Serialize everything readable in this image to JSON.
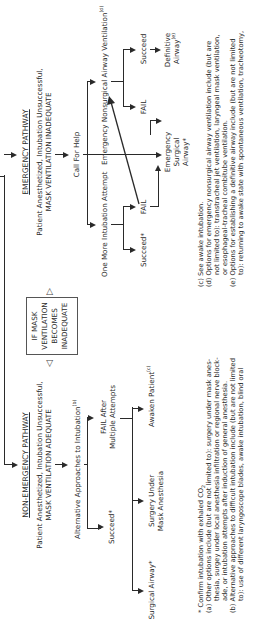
{
  "document": {
    "title": "Difficult Airway Algorithm (continued)",
    "orientation": "rotated 90 degrees counter-clockwise"
  },
  "non_emergency": {
    "heading": "NON-EMERGENCY PATHWAY",
    "condition_line1": "Patient Anesthetized, Intubation Unsuccessful,",
    "condition_line2": "MASK VENTILATION ADEQUATE",
    "alt_approaches": "Alternative Approaches to Intubation",
    "alt_approaches_ref": "(b)",
    "succeed": "Succeed*",
    "fail_line1": "FAIL After",
    "fail_line2": "Multiple Attempts",
    "surgical_airway": "Surgical Airway*",
    "surgery_mask_line1": "Surgery Under",
    "surgery_mask_line2": "Mask Anesthesia",
    "awaken": "Awaken Patient",
    "awaken_ref": "(c)"
  },
  "transition_box": {
    "line1": "IF MASK",
    "line2": "VENTILATION",
    "line3": "BECOMES",
    "line4": "INADEQUATE"
  },
  "emergency": {
    "heading": "EMERGENCY PATHWAY",
    "condition_line1": "Patient Anesthetized, Intubation Unsuccessful,",
    "condition_line2": "MASK VENTILATION INADEQUATE",
    "call_help": "Call For Help",
    "one_more": "One More Intubation Attempt",
    "succeed": "Succeed*",
    "fail": "FAIL",
    "nonsurgical": "Emergency Nonsurgical Airway Ventilation",
    "nonsurgical_ref": "(d)",
    "nonsurgical_succeed": "Succeed",
    "nonsurgical_fail": "FAIL",
    "definitive_line1": "Definitive",
    "definitive_line2": "Airway",
    "definitive_ref": "(e)",
    "surgical_line1": "Emergency",
    "surgical_line2": "Surgical",
    "surgical_line3": "Airway*"
  },
  "footnotes": {
    "star": "* Confirm intubation with exhaled CO",
    "star_sub": "2",
    "a1": "(a)  Other options include (but are not limited to):  surgery under mask anes-",
    "a2": "thesia, surgey under local anesthesia infiltration or regional nerve block-",
    "a3": "ade, or intubation attempts after induction of general anesthesia.",
    "b1": "(b)  Alternative approaches to difficult intubation include (but are not limited",
    "b2": "to):  use of different laryngoscope blades, awake intubation, blind oral",
    "c1": "(c)  See awake intubation.",
    "d1": "(d)  Options for emergency nonsurgical airway ventilation include (but are",
    "d2": "not limited to):  transtracheal jet ventilation, laryngeal mask ventilation,",
    "d3": "or esophageal-tracheal combitube ventilation.",
    "e1": "(e)  Options for establishing a definitive airway include (but are not limited",
    "e2": "to):  returning to awake state with spontaneous ventilation, tracheotomy,"
  }
}
